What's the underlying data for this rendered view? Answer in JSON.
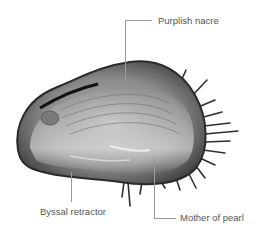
{
  "figure": {
    "labels": [
      {
        "id": "purplish-nacre",
        "text": "Purplish nacre"
      },
      {
        "id": "byssal-retractor",
        "text": "Byssal retractor"
      },
      {
        "id": "mother-of-pearl",
        "text": "Mother of pearl"
      }
    ]
  }
}
